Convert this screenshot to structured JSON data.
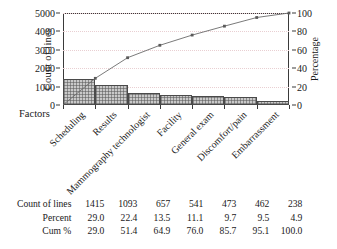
{
  "chart_data": {
    "type": "bar",
    "title": "",
    "subtitle": "",
    "xlabel": "Factors",
    "ylabel": "Count of lines",
    "y2label": "Percentage",
    "ylim": [
      0,
      5000
    ],
    "y2lim": [
      0,
      100
    ],
    "yticks": [
      0,
      1000,
      2000,
      3000,
      4000,
      5000
    ],
    "y2ticks": [
      0,
      20,
      40,
      60,
      80,
      100
    ],
    "grid": true,
    "legend": "none",
    "categories": [
      "Scheduling",
      "Results",
      "Mammography technologist",
      "Facility",
      "General exam",
      "Discomfort/pain",
      "Embarrassment"
    ],
    "values": [
      1415,
      1093,
      657,
      541,
      473,
      462,
      238
    ],
    "series": [
      {
        "name": "Count of lines",
        "type": "bar",
        "axis": "left",
        "values": [
          1415,
          1093,
          657,
          541,
          473,
          462,
          238
        ]
      },
      {
        "name": "Cum %",
        "type": "line",
        "axis": "right",
        "values": [
          29.0,
          51.4,
          64.9,
          76.0,
          85.7,
          95.1,
          100.0
        ]
      }
    ],
    "percent": [
      29.0,
      22.4,
      13.5,
      11.1,
      9.7,
      9.5,
      4.9
    ],
    "cum_percent": [
      29.0,
      51.4,
      64.9,
      76.0,
      85.7,
      95.1,
      100.0
    ]
  },
  "axes": {
    "y_left_title": "Count of lines",
    "y_right_title": "Percentage",
    "x_title": "Factors",
    "y_left_ticks": [
      "5000",
      "4000",
      "3000",
      "2000",
      "1000",
      "0"
    ],
    "y_right_ticks": [
      "100",
      "80",
      "60",
      "40",
      "20",
      "0"
    ]
  },
  "table": {
    "rows": [
      {
        "label": "Count of lines",
        "values": [
          "1415",
          "1093",
          "657",
          "541",
          "473",
          "462",
          "238"
        ]
      },
      {
        "label": "Percent",
        "values": [
          "29.0",
          "22.4",
          "13.5",
          "11.1",
          "9.7",
          "9.5",
          "4.9"
        ]
      },
      {
        "label": "Cum %",
        "values": [
          "29.0",
          "51.4",
          "64.9",
          "76.0",
          "85.7",
          "95.1",
          "100.0"
        ]
      }
    ]
  },
  "colors": {
    "bar_fill": "#c9c9c9",
    "bar_border": "#4a4a4a",
    "line": "#6b6b6b",
    "grid": "#e9cfd2",
    "axis": "#3a3a3a",
    "text": "#1a1a1a",
    "background": "#ffffff"
  }
}
